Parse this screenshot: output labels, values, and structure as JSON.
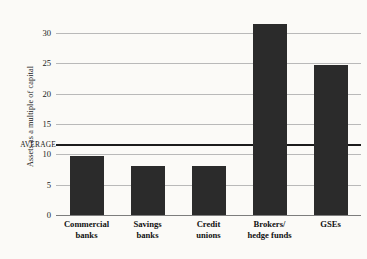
{
  "chart_data": {
    "type": "bar",
    "title": "",
    "xlabel": "",
    "ylabel": "Assets as a multiple of capital",
    "categories": [
      "Commercial\nbanks",
      "Savings\nbanks",
      "Credit\nunions",
      "Brokers/\nhedge funds",
      "GSEs"
    ],
    "values": [
      9.7,
      8.1,
      8.1,
      31.5,
      24.8
    ],
    "ylim": [
      0,
      32.5
    ],
    "yticks": [
      0,
      5,
      10,
      15,
      20,
      25,
      30
    ],
    "ytick_labels": [
      "0",
      "5",
      "10",
      "15",
      "20",
      "25",
      "30"
    ],
    "grid": true,
    "legend": false,
    "annotations": [
      {
        "name": "average-line",
        "label": "AVERAGE",
        "value": 11.5
      }
    ],
    "colors": {
      "bar": "#2b2b2b",
      "gridline": "#b9b9b9",
      "axis": "#7d7d7d",
      "average_line": "#1c1c1c",
      "background": "#fbfaf7",
      "text": "#1a1a1a"
    }
  }
}
